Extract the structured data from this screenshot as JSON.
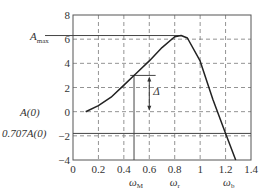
{
  "chart_data": {
    "type": "line",
    "title": "",
    "xlabel": "",
    "ylabel": "",
    "xlim": [
      0,
      1.4
    ],
    "ylim": [
      -4,
      8
    ],
    "x_ticks": [
      "0",
      "0.2",
      "0.4",
      "0.6",
      "0.8",
      "1",
      "1.2",
      "1.4"
    ],
    "y_ticks": [
      "8",
      "6",
      "4",
      "2",
      "0",
      "-2",
      "-4"
    ],
    "grid": true,
    "series": [
      {
        "name": "A(ω)",
        "x": [
          0.1,
          0.2,
          0.3,
          0.4,
          0.5,
          0.6,
          0.7,
          0.8,
          0.85,
          0.9,
          1.0,
          1.1,
          1.2,
          1.28
        ],
        "values": [
          0.0,
          0.5,
          1.2,
          2.2,
          3.2,
          4.2,
          5.3,
          6.2,
          6.3,
          6.1,
          4.2,
          1.0,
          -1.8,
          -4.0
        ]
      }
    ],
    "annotations": {
      "A_max": {
        "label": "A",
        "sub": "max",
        "y": 6.3
      },
      "A0": {
        "label": "A(0)",
        "y": 0
      },
      "A707": {
        "label": "0.707A(0)",
        "y": -1.8
      },
      "delta": {
        "label": "Δ",
        "x": 0.6,
        "y_from": 3.0,
        "y_to": 0.0
      },
      "omega_M": {
        "label": "ω",
        "sub": "M",
        "x": 0.48
      },
      "omega_r": {
        "label": "ω",
        "sub": "r",
        "x": 0.8
      },
      "omega_b": {
        "label": "ω",
        "sub": "b",
        "x": 1.22
      }
    }
  }
}
